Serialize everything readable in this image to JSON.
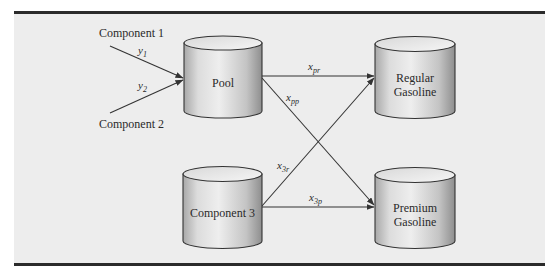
{
  "diagram": {
    "title": "",
    "colors": {
      "background": "#ededed",
      "rule": "#2b2b2b",
      "cylinder_light": "#f2f2f2",
      "cylinder_dark": "#9a9a9a",
      "stroke": "#333333"
    },
    "nodes": {
      "component1": {
        "label": "Component 1"
      },
      "component2": {
        "label": "Component 2"
      },
      "pool": {
        "label": "Pool"
      },
      "component3": {
        "label": "Component 3"
      },
      "regular": {
        "label_line1": "Regular",
        "label_line2": "Gasoline"
      },
      "premium": {
        "label_line1": "Premium",
        "label_line2": "Gasoline"
      }
    },
    "edges": [
      {
        "from": "Component 1",
        "to": "Pool",
        "var": "y",
        "sub": "1"
      },
      {
        "from": "Component 2",
        "to": "Pool",
        "var": "y",
        "sub": "2"
      },
      {
        "from": "Pool",
        "to": "Regular Gasoline",
        "var": "x",
        "sub": "pr"
      },
      {
        "from": "Pool",
        "to": "Premium Gasoline",
        "var": "x",
        "sub": "pp"
      },
      {
        "from": "Component 3",
        "to": "Regular Gasoline",
        "var": "x",
        "sub": "3r"
      },
      {
        "from": "Component 3",
        "to": "Premium Gasoline",
        "var": "x",
        "sub": "3p"
      }
    ]
  }
}
